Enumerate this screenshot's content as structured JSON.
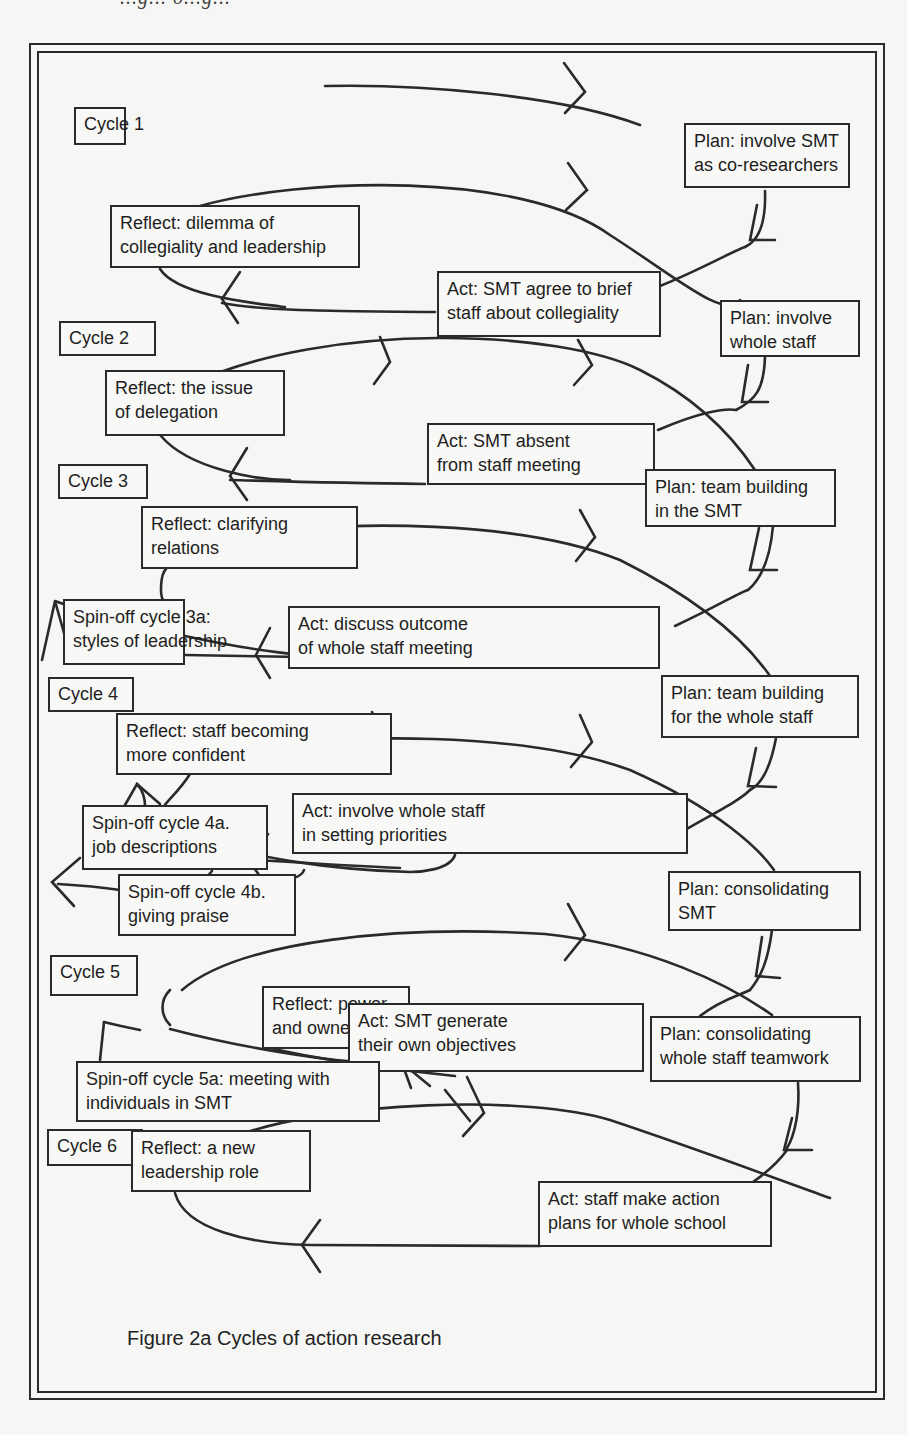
{
  "header_fragment": "...g... o...g...",
  "cycles": [
    {
      "label": "Cycle 1"
    },
    {
      "label": "Cycle 2"
    },
    {
      "label": "Cycle 3"
    },
    {
      "label": "Cycle 4"
    },
    {
      "label": "Cycle 5"
    },
    {
      "label": "Cycle 6"
    }
  ],
  "steps": {
    "c1_plan": [
      "Plan: involve SMT",
      "as co-researchers"
    ],
    "c1_reflect": [
      "Reflect: dilemma of",
      "collegiality and leadership"
    ],
    "c1_act": [
      "Act: SMT agree to brief",
      "staff about collegiality"
    ],
    "c2_plan": [
      "Plan: involve",
      "whole staff"
    ],
    "c2_reflect": [
      "Reflect: the issue",
      "of delegation"
    ],
    "c2_act": [
      "Act: SMT absent",
      "from staff meeting"
    ],
    "c3_plan": [
      "Plan: team building",
      "in the SMT"
    ],
    "c3_reflect": [
      "Reflect: clarifying",
      "relations"
    ],
    "c3_spinoff_a": [
      "Spin-off cycle 3a:",
      "styles of leadership"
    ],
    "c3_act": [
      "Act: discuss outcome",
      "of whole staff meeting"
    ],
    "c4_plan": [
      "Plan: team building",
      "for the whole staff"
    ],
    "c4_reflect": [
      "Reflect: staff becoming",
      "more confident"
    ],
    "c4_act": [
      "Act: involve whole staff",
      "in setting priorities"
    ],
    "c4_spinoff_a": [
      "Spin-off cycle 4a.",
      "job descriptions"
    ],
    "c4_spinoff_b": [
      "Spin-off cycle 4b.",
      "giving praise"
    ],
    "c5_plan_smt": [
      "Plan: consolidating",
      "SMT"
    ],
    "c5_reflect": [
      "Reflect: power",
      "and ownership"
    ],
    "c5_act": [
      "Act: SMT generate",
      "their own objectives"
    ],
    "c5_plan_whole": [
      "Plan: consolidating",
      "whole staff teamwork"
    ],
    "c5_spinoff_a": [
      "Spin-off cycle 5a: meeting with",
      "individuals in SMT"
    ],
    "c6_reflect": [
      "Reflect: a new",
      "leadership role"
    ],
    "c6_act": [
      "Act: staff make action",
      "plans for whole school"
    ]
  },
  "caption": "Figure 2a  Cycles of action research",
  "colors": {
    "ink": "#2a2a2a",
    "paper": "#f6f6f4"
  }
}
